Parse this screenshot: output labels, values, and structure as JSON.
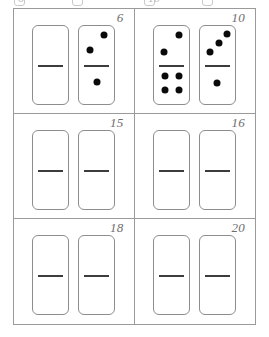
{
  "grid": {
    "columns": 2,
    "rows": 3,
    "cells": [
      {
        "label": "6",
        "dominoes": [
          {
            "top_pips": 0,
            "bottom_pips": 0,
            "top_layout": [],
            "bottom_layout": []
          },
          {
            "top_pips": 2,
            "bottom_pips": 1,
            "top_layout": [
              [
                72,
                24
              ],
              [
                30,
                62
              ]
            ],
            "bottom_layout": [
              [
                50,
                42
              ]
            ]
          }
        ]
      },
      {
        "label": "10",
        "dominoes": [
          {
            "top_pips": 2,
            "bottom_pips": 4,
            "top_layout": [
              [
                72,
                24
              ],
              [
                28,
                66
              ]
            ],
            "bottom_layout": [
              [
                30,
                26
              ],
              [
                72,
                26
              ],
              [
                30,
                62
              ],
              [
                72,
                62
              ]
            ]
          },
          {
            "top_pips": 3,
            "bottom_pips": 1,
            "top_layout": [
              [
                76,
                20
              ],
              [
                54,
                44
              ],
              [
                28,
                66
              ]
            ],
            "bottom_layout": [
              [
                48,
                44
              ]
            ]
          }
        ]
      },
      {
        "label": "15",
        "dominoes": [
          {
            "top_pips": 0,
            "bottom_pips": 0,
            "top_layout": [],
            "bottom_layout": []
          },
          {
            "top_pips": 0,
            "bottom_pips": 0,
            "top_layout": [],
            "bottom_layout": []
          }
        ]
      },
      {
        "label": "16",
        "dominoes": [
          {
            "top_pips": 0,
            "bottom_pips": 0,
            "top_layout": [],
            "bottom_layout": []
          },
          {
            "top_pips": 0,
            "bottom_pips": 0,
            "top_layout": [],
            "bottom_layout": []
          }
        ]
      },
      {
        "label": "18",
        "dominoes": [
          {
            "top_pips": 0,
            "bottom_pips": 0,
            "top_layout": [],
            "bottom_layout": []
          },
          {
            "top_pips": 0,
            "bottom_pips": 0,
            "top_layout": [],
            "bottom_layout": []
          }
        ]
      },
      {
        "label": "20",
        "dominoes": [
          {
            "top_pips": 0,
            "bottom_pips": 0,
            "top_layout": [],
            "bottom_layout": []
          },
          {
            "top_pips": 0,
            "bottom_pips": 0,
            "top_layout": [],
            "bottom_layout": []
          }
        ]
      }
    ]
  },
  "clipped_remnant": {
    "labels": [
      "6",
      "10"
    ],
    "label_positions": [
      18,
      148
    ],
    "box_positions": [
      14,
      72,
      144,
      202
    ]
  },
  "colors": {
    "grid_line": "#9a9a9a",
    "domino_border": "#8d8d8d",
    "divider": "#3c3c3c",
    "pip": "#0a0a0a",
    "label_text": "#6e6e6e",
    "background": "#ffffff"
  }
}
